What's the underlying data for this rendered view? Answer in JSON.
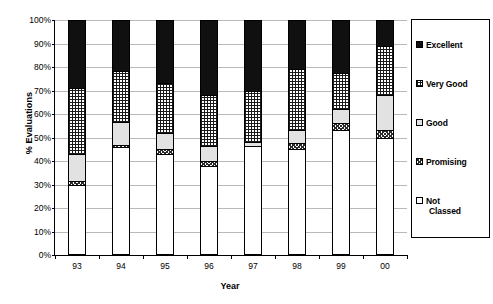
{
  "chart_data": {
    "type": "bar",
    "subtype": "100% stacked column",
    "title": "",
    "xlabel": "Year",
    "ylabel": "% Evaluations",
    "ylim": [
      0,
      100
    ],
    "y_unit": "%",
    "grid": true,
    "legend_position": "right",
    "categories": [
      "93",
      "94",
      "95",
      "96",
      "97",
      "98",
      "99",
      "00"
    ],
    "ytick_labels": [
      "0%",
      "10%",
      "20%",
      "30%",
      "40%",
      "50%",
      "60%",
      "70%",
      "80%",
      "90%",
      "100%"
    ],
    "ytick_values": [
      0,
      10,
      20,
      30,
      40,
      50,
      60,
      70,
      80,
      90,
      100
    ],
    "series": [
      {
        "name": "Not Classed",
        "pattern": "notclassed",
        "values": [
          30.0,
          46.0,
          43.0,
          38.0,
          46.5,
          45.0,
          53.0,
          50.0
        ]
      },
      {
        "name": "Promising",
        "pattern": "promising",
        "values": [
          1.5,
          0.8,
          2.0,
          2.0,
          0.0,
          2.5,
          3.0,
          3.0
        ]
      },
      {
        "name": "Good",
        "pattern": "good",
        "values": [
          11.5,
          9.7,
          7.0,
          6.5,
          1.5,
          5.5,
          6.0,
          15.0
        ]
      },
      {
        "name": "Very Good",
        "pattern": "verygood",
        "values": [
          28.0,
          22.0,
          21.0,
          21.5,
          22.0,
          26.0,
          15.5,
          21.0
        ]
      },
      {
        "name": "Excellent",
        "pattern": "excellent",
        "values": [
          29.0,
          21.5,
          27.0,
          32.0,
          30.0,
          21.0,
          22.5,
          11.0
        ]
      }
    ],
    "legend": [
      {
        "label": "Excellent",
        "pattern": "excellent"
      },
      {
        "label": "Very Good",
        "pattern": "verygood"
      },
      {
        "label": "Good",
        "pattern": "good"
      },
      {
        "label": "Promising",
        "pattern": "promising"
      },
      {
        "label": "Not Classed",
        "pattern": "notclassed",
        "line1": "Not",
        "line2": "Classed"
      }
    ],
    "colors": {
      "excellent": "#101010",
      "verygood": "#ffffff",
      "good": "#e2e2e2",
      "promising": "#ffffff",
      "notclassed": "#ffffff",
      "axis": "#000000",
      "gridline": "#b9b9b9"
    }
  }
}
